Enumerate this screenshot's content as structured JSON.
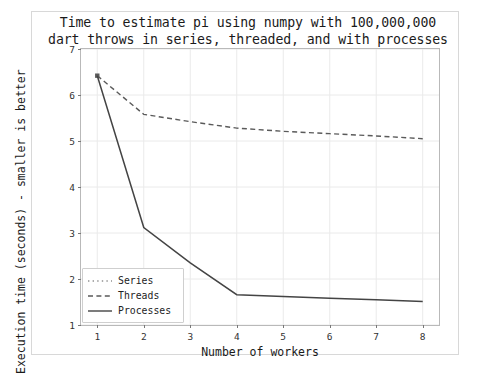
{
  "chart_data": {
    "type": "line",
    "title": "Time to estimate pi using numpy with 100,000,000\ndart throws in series, threaded, and with processes",
    "xlabel": "Number of workers",
    "ylabel": "Execution time (seconds) - smaller is better",
    "x": [
      1,
      2,
      3,
      4,
      5,
      6,
      7,
      8
    ],
    "xlim": [
      0.65,
      8.35
    ],
    "ylim": [
      1.0,
      7.0
    ],
    "xticks": [
      1,
      2,
      3,
      4,
      5,
      6,
      7,
      8
    ],
    "yticks": [
      1,
      2,
      3,
      4,
      5,
      6,
      7
    ],
    "grid": true,
    "legend_position": "lower left",
    "series": [
      {
        "name": "Series",
        "style": "dotted",
        "color": "#5a5a5a",
        "x": [
          1
        ],
        "values": [
          6.42
        ]
      },
      {
        "name": "Threads",
        "style": "dashed",
        "color": "#5a5a5a",
        "x": [
          1,
          2,
          3,
          4,
          5,
          6,
          7,
          8
        ],
        "values": [
          6.42,
          5.58,
          5.42,
          5.28,
          5.21,
          5.16,
          5.11,
          5.05
        ]
      },
      {
        "name": "Processes",
        "style": "solid",
        "color": "#444444",
        "x": [
          1,
          2,
          3,
          4,
          5,
          6,
          7,
          8
        ],
        "values": [
          6.42,
          3.12,
          2.35,
          1.66,
          1.62,
          1.58,
          1.55,
          1.51
        ]
      }
    ]
  },
  "figure": {
    "background": "#ffffff",
    "frame_color": "#d8d8d8",
    "axes_color": "#b9b9b9",
    "grid_color": "#eaeaea"
  }
}
